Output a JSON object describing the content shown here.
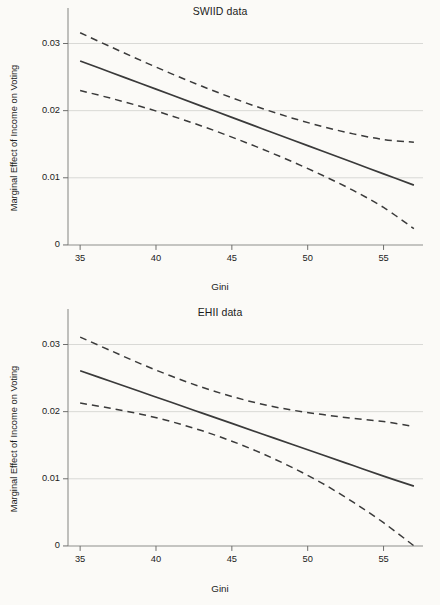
{
  "figure": {
    "xlabel": "Gini",
    "ylabel": "Marginal Effect of Income on Voting"
  },
  "chart_data": [
    {
      "type": "line",
      "title": "SWIID data",
      "xlabel": "Gini",
      "ylabel": "Marginal Effect of Income on Voting",
      "xlim": [
        34.2,
        57.6
      ],
      "ylim": [
        -0.0012,
        0.0335
      ],
      "xticks": [
        35,
        40,
        45,
        50,
        55
      ],
      "xticklabels": [
        "35",
        "40",
        "45",
        "50",
        "55"
      ],
      "yticks": [
        0,
        0.01,
        0.02,
        0.03
      ],
      "yticklabels": [
        "0",
        "0.01",
        "0.02",
        "0.03"
      ],
      "grid": true,
      "legend": "none",
      "x": [
        35,
        37,
        39,
        41,
        43,
        45,
        47,
        49,
        51,
        53,
        55,
        57
      ],
      "series": [
        {
          "name": "Marginal effect (point estimate)",
          "style": "solid",
          "values": [
            0.0274,
            0.02572,
            0.02404,
            0.02236,
            0.02068,
            0.019,
            0.01731,
            0.01563,
            0.01395,
            0.01227,
            0.01059,
            0.00891
          ]
        },
        {
          "name": "95% confidence interval (upper)",
          "style": "dashed",
          "values": [
            0.0316,
            0.02952,
            0.02748,
            0.02552,
            0.02366,
            0.02192,
            0.02032,
            0.01888,
            0.01762,
            0.01654,
            0.0157,
            0.0153
          ]
        },
        {
          "name": "95% confidence interval (lower)",
          "style": "dashed",
          "values": [
            0.023,
            0.02186,
            0.02062,
            0.01924,
            0.01772,
            0.01606,
            0.01428,
            0.01238,
            0.01034,
            0.00812,
            0.00558,
            0.00243
          ]
        }
      ]
    },
    {
      "type": "line",
      "title": "EHII data",
      "xlabel": "Gini",
      "ylabel": "Marginal Effect of Income on Voting",
      "xlim": [
        34.2,
        57.6
      ],
      "ylim": [
        -0.0012,
        0.0335
      ],
      "xticks": [
        35,
        40,
        45,
        50,
        55
      ],
      "xticklabels": [
        "35",
        "40",
        "45",
        "50",
        "55"
      ],
      "yticks": [
        0,
        0.01,
        0.02,
        0.03
      ],
      "yticklabels": [
        "0",
        "0.01",
        "0.02",
        "0.03"
      ],
      "grid": true,
      "legend": "none",
      "x": [
        35,
        37,
        39,
        41,
        43,
        45,
        47,
        49,
        51,
        53,
        55,
        57
      ],
      "series": [
        {
          "name": "Marginal effect (point estimate)",
          "style": "solid",
          "values": [
            0.0261,
            0.02453,
            0.02296,
            0.02139,
            0.01982,
            0.01825,
            0.01668,
            0.01511,
            0.01354,
            0.01197,
            0.0104,
            0.0089
          ]
        },
        {
          "name": "95% confidence interval (upper)",
          "style": "dashed",
          "values": [
            0.0311,
            0.0291,
            0.02712,
            0.0253,
            0.02366,
            0.02226,
            0.0211,
            0.02022,
            0.01956,
            0.019,
            0.01852,
            0.0178
          ]
        },
        {
          "name": "95% confidence interval (lower)",
          "style": "dashed",
          "values": [
            0.02128,
            0.0205,
            0.01962,
            0.01852,
            0.01718,
            0.0156,
            0.01376,
            0.01166,
            0.00928,
            0.00652,
            0.00346,
            2e-05
          ]
        }
      ]
    }
  ],
  "panels": [
    {
      "title": "SWIID data"
    },
    {
      "title": "EHII data"
    }
  ]
}
